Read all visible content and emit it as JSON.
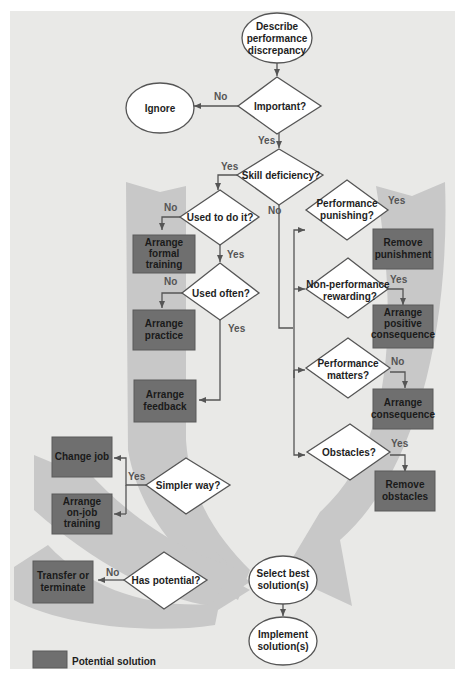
{
  "diagram": {
    "type": "flowchart",
    "colors": {
      "background": "#e9e9e7",
      "solution_box": "#6f6f6f",
      "arrow_band": "#c8c8c8",
      "line": "#555555"
    },
    "terminals": {
      "start": [
        "Describe",
        "performance",
        "discrepancy"
      ],
      "ignore": [
        "Ignore"
      ],
      "select": [
        "Select best",
        "solution(s)"
      ],
      "implement": [
        "Implement",
        "solution(s)"
      ]
    },
    "decisions": {
      "important": [
        "Important?"
      ],
      "skill": [
        "Skill deficiency?"
      ],
      "used_to": [
        "Used to do it?"
      ],
      "used_often": [
        "Used often?"
      ],
      "perf_punishing": [
        "Performance",
        "punishing?"
      ],
      "nonperf_rewarding": [
        "Non-performance",
        "rewarding?"
      ],
      "perf_matters": [
        "Performance",
        "matters?"
      ],
      "obstacles": [
        "Obstacles?"
      ],
      "simpler": [
        "Simpler way?"
      ],
      "potential": [
        "Has potential?"
      ]
    },
    "solutions": {
      "formal_training": [
        "Arrange",
        "formal",
        "training"
      ],
      "practice": [
        "Arrange",
        "practice"
      ],
      "feedback": [
        "Arrange",
        "feedback"
      ],
      "remove_punishment": [
        "Remove",
        "punishment"
      ],
      "positive_consequence": [
        "Arrange",
        "positive",
        "consequence"
      ],
      "consequence": [
        "Arrange",
        "consequence"
      ],
      "remove_obstacles": [
        "Remove",
        "obstacles"
      ],
      "change_job": [
        "Change job"
      ],
      "onjob_training": [
        "Arrange",
        "on-job",
        "training"
      ],
      "transfer": [
        "Transfer or",
        "terminate"
      ]
    },
    "edge_labels": {
      "important_no": "No",
      "important_yes": "Yes",
      "skill_yes": "Yes",
      "skill_no": "No",
      "used_to_no": "No",
      "used_to_yes": "Yes",
      "used_often_no": "No",
      "used_often_yes": "Yes",
      "punishing_yes": "Yes",
      "rewarding_yes": "Yes",
      "matters_no": "No",
      "obstacles_yes": "Yes",
      "simpler_yes": "Yes",
      "potential_no": "No"
    },
    "legend": {
      "label": "Potential solution"
    }
  }
}
